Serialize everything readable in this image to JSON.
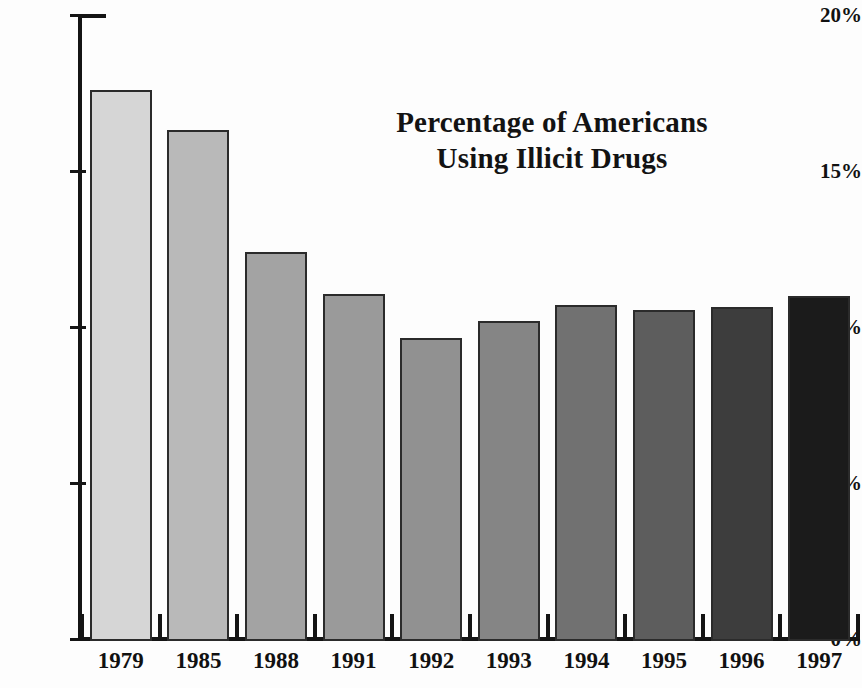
{
  "chart_data": {
    "type": "bar",
    "title": "Percentage of Americans Using Illicit Drugs",
    "title_lines": [
      "Percentage of Americans",
      "Using Illicit Drugs"
    ],
    "xlabel": "",
    "ylabel": "",
    "ylim": [
      0,
      20
    ],
    "grid": false,
    "legend": "none",
    "ytick_labels": [
      "0%",
      "5%",
      "10%",
      "15%",
      "20%"
    ],
    "ytick_values": [
      0,
      5,
      10,
      15,
      20
    ],
    "categories": [
      "1979",
      "1985",
      "1988",
      "1991",
      "1992",
      "1993",
      "1994",
      "1995",
      "1996",
      "1997"
    ],
    "values": [
      17.6,
      16.3,
      12.4,
      11.05,
      9.65,
      10.2,
      10.7,
      10.55,
      10.65,
      11.0
    ],
    "bar_colors": [
      "#d6d6d6",
      "#b9b9b9",
      "#a3a3a3",
      "#9a9a9a",
      "#919191",
      "#858585",
      "#717171",
      "#5d5d5d",
      "#3d3d3d",
      "#1b1b1b"
    ],
    "bar_edge_color": "#2b2b2b",
    "axis_color": "#141414",
    "background_color": "#fdfdfd",
    "text_color": "#111111"
  }
}
